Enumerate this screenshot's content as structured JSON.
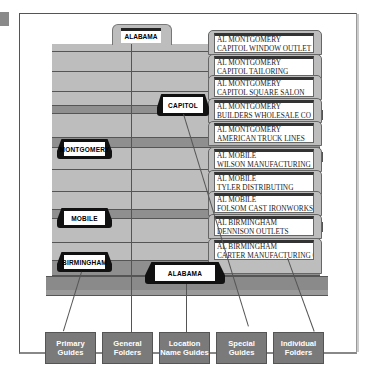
{
  "figure": {
    "primary_guide_top": "ALABAMA",
    "special_guide_top": "CAPITOL",
    "general_folder_bottom": "ALABAMA",
    "location_guides": [
      "MONTGOMERY",
      "MOBILE",
      "BIRMINGHAM"
    ],
    "individual_folders": [
      {
        "line1": "AL MONTGOMERY",
        "line2": "CAPITOL WINDOW OUTLET"
      },
      {
        "line1": "AL MONTGOMERY",
        "line2": "CAPITOL TAILORING"
      },
      {
        "line1": "AL MONTGOMERY",
        "line2": "CAPITOL SQUARE SALON"
      },
      {
        "line1": "AL MONTGOMERY",
        "line2": "BUILDERS WHOLESALE CO"
      },
      {
        "line1": "AL MONTGOMERY",
        "line2": "AMERICAN TRUCK LINES"
      },
      {
        "line1": "AL MOBILE",
        "line2": "WILSON MANUFACTURING"
      },
      {
        "line1": "AL MOBILE",
        "line2": "TYLER DISTRIBUTING"
      },
      {
        "line1": "AL MOBILE",
        "line2": "FOLSOM CAST IRONWORKS"
      },
      {
        "line1": "AL BIRMINGHAM",
        "line2": "DENNISON OUTLETS"
      },
      {
        "line1": "AL BIRMINGHAM",
        "line2": "CARTER MANUFACTURING CO"
      }
    ],
    "captions": [
      {
        "line1": "Primary",
        "line2": "Guides"
      },
      {
        "line1": "General",
        "line2": "Folders"
      },
      {
        "line1": "Location",
        "line2": "Name Guides"
      },
      {
        "line1": "Special",
        "line2": "Guides"
      },
      {
        "line1": "Individual",
        "line2": "Folders"
      }
    ],
    "colors": {
      "folder": "#bdbdbd",
      "folder_dark": "#8f8f8f",
      "caption_box": "#7a7a7a",
      "guide_tab": "#111111"
    }
  }
}
